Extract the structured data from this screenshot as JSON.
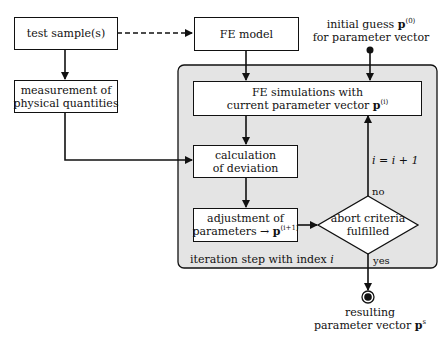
{
  "diagram": {
    "nodes": {
      "test_sample": {
        "label": "test sample(s)"
      },
      "fe_model": {
        "label": "FE model"
      },
      "measurement": {
        "line1": "measurement of",
        "line2": "physical quantities"
      },
      "fe_simulations": {
        "line1": "FE simulations with",
        "line2": "current parameter vector",
        "vec": "p",
        "sup": "(i)"
      },
      "calculation": {
        "line1": "calculation",
        "line2": "of deviation"
      },
      "adjustment": {
        "line1": "adjustment of",
        "line2": "parameters →",
        "vec": "p",
        "sup": "(i+1)"
      },
      "abort_criteria": {
        "line1": "abort criteria",
        "line2": "fulfilled"
      },
      "initial_guess": {
        "line1": "initial guess",
        "vec": "p",
        "sup": "(0)",
        "line2": "for parameter vector"
      },
      "result": {
        "line1": "resulting",
        "line2": "parameter vector",
        "vec": "p",
        "sup": "s"
      }
    },
    "labels": {
      "iteration_region": "iteration step with index",
      "iteration_index": "i",
      "increment": "i = i + 1",
      "no": "no",
      "yes": "yes"
    },
    "colors": {
      "panel_fill": "#e4e4e4",
      "stroke": "#111111",
      "box_fill": "#ffffff"
    }
  }
}
